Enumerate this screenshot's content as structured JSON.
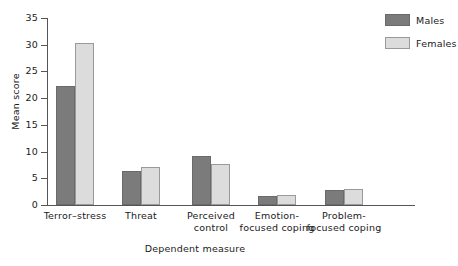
{
  "chart_data": {
    "type": "bar",
    "title": "",
    "xlabel": "Dependent measure",
    "ylabel": "Mean score",
    "categories": [
      "Terror–stress",
      "Threat",
      "Perceived\ncontrol",
      "Emotion-\nfocused coping",
      "Problem-\nfocused coping"
    ],
    "series": [
      {
        "name": "Males",
        "color": "#7b7b7b",
        "values": [
          22.3,
          6.3,
          9.2,
          1.7,
          2.9
        ]
      },
      {
        "name": "Females",
        "color": "#dcdcdc",
        "values": [
          30.4,
          7.1,
          7.7,
          1.8,
          3.0
        ]
      }
    ],
    "ylim": [
      0,
      35
    ],
    "yticks": [
      0,
      5,
      10,
      15,
      20,
      25,
      30,
      35
    ],
    "ytick_labels": [
      "0",
      "5",
      "10",
      "15",
      "20",
      "25",
      "30",
      "35"
    ],
    "grid": false,
    "legend_position": "top-right",
    "legend_entries": [
      "Males",
      "Females"
    ]
  }
}
